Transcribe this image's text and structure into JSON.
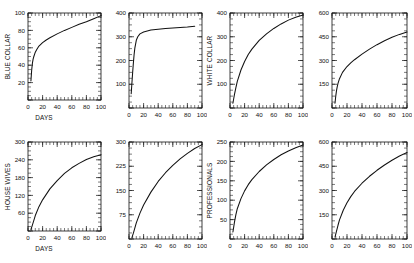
{
  "figure": {
    "layout": "2 rows x 4 columns of small-multiple line plots",
    "background_color": "#ffffff",
    "line_color": "#111111"
  },
  "chart_data": [
    {
      "type": "line",
      "title": "",
      "xlabel": "DAYS",
      "ylabel": "BLUE COLLAR",
      "xlim": [
        0,
        100
      ],
      "ylim": [
        0,
        100
      ],
      "xticks": [
        0,
        20,
        40,
        60,
        80,
        100
      ],
      "yticks": [
        0,
        20,
        40,
        60,
        80,
        100
      ],
      "grid": false,
      "legend": "none",
      "minor_ticks": true,
      "x": [
        4,
        5,
        6,
        7,
        8,
        10,
        12,
        15,
        20,
        25,
        30,
        40,
        50,
        60,
        70,
        80,
        90,
        100
      ],
      "values": [
        22,
        34,
        42,
        47,
        50,
        55,
        58,
        62,
        66,
        69,
        71.5,
        76,
        80,
        83.5,
        87,
        90,
        93.5,
        97
      ]
    },
    {
      "type": "line",
      "title": "",
      "xlabel": "",
      "ylabel": "",
      "xlim": [
        0,
        100
      ],
      "ylim": [
        0,
        400
      ],
      "xticks": [
        0,
        20,
        40,
        60,
        80,
        100
      ],
      "yticks": [
        0,
        100,
        200,
        300,
        400
      ],
      "grid": false,
      "legend": "none",
      "minor_ticks": true,
      "x": [
        3,
        4,
        5,
        6,
        7,
        8,
        10,
        12,
        15,
        20,
        30,
        40,
        50,
        60,
        70,
        80,
        90
      ],
      "values": [
        60,
        105,
        150,
        190,
        225,
        252,
        285,
        300,
        312,
        320,
        328,
        332,
        335,
        337,
        339,
        341,
        344
      ]
    },
    {
      "type": "line",
      "title": "",
      "xlabel": "",
      "ylabel": "WHITE COLLAR",
      "xlim": [
        0,
        100
      ],
      "ylim": [
        0,
        400
      ],
      "xticks": [
        0,
        20,
        40,
        60,
        80,
        100
      ],
      "yticks": [
        0,
        100,
        200,
        300,
        400
      ],
      "grid": false,
      "legend": "none",
      "minor_ticks": true,
      "x": [
        4,
        5,
        6,
        8,
        10,
        15,
        20,
        25,
        30,
        40,
        50,
        60,
        70,
        80,
        90,
        100
      ],
      "values": [
        20,
        38,
        55,
        85,
        112,
        160,
        196,
        225,
        248,
        285,
        312,
        335,
        354,
        370,
        382,
        392
      ]
    },
    {
      "type": "line",
      "title": "",
      "xlabel": "",
      "ylabel": "",
      "xlim": [
        0,
        100
      ],
      "ylim": [
        0,
        600
      ],
      "xticks": [
        0,
        20,
        40,
        60,
        80,
        100
      ],
      "yticks": [
        0,
        150,
        300,
        450,
        600
      ],
      "grid": false,
      "legend": "none",
      "minor_ticks": true,
      "x": [
        4,
        5,
        6,
        7,
        8,
        10,
        14,
        20,
        25,
        30,
        40,
        50,
        60,
        70,
        80,
        90,
        100
      ],
      "values": [
        30,
        75,
        110,
        135,
        155,
        185,
        225,
        262,
        285,
        305,
        340,
        372,
        400,
        425,
        447,
        465,
        480
      ]
    },
    {
      "type": "line",
      "title": "",
      "xlabel": "DAYS",
      "ylabel": "HOUSE WIVES",
      "xlim": [
        0,
        100
      ],
      "ylim": [
        0,
        300
      ],
      "xticks": [
        0,
        20,
        40,
        60,
        80,
        100
      ],
      "yticks": [
        0,
        60,
        120,
        180,
        240,
        300
      ],
      "grid": false,
      "legend": "none",
      "minor_ticks": true,
      "x": [
        4,
        6,
        10,
        15,
        20,
        30,
        40,
        50,
        60,
        70,
        80,
        90,
        100
      ],
      "values": [
        5,
        20,
        52,
        82,
        105,
        142,
        170,
        194,
        213,
        228,
        241,
        250,
        257
      ]
    },
    {
      "type": "line",
      "title": "",
      "xlabel": "",
      "ylabel": "",
      "xlim": [
        0,
        100
      ],
      "ylim": [
        0,
        300
      ],
      "xticks": [
        0,
        20,
        40,
        60,
        80,
        100
      ],
      "yticks": [
        0,
        75,
        150,
        225,
        300
      ],
      "grid": false,
      "legend": "none",
      "minor_ticks": true,
      "x": [
        4,
        6,
        10,
        15,
        20,
        30,
        40,
        50,
        60,
        70,
        80,
        90,
        100
      ],
      "values": [
        4,
        18,
        50,
        80,
        105,
        145,
        178,
        205,
        228,
        248,
        265,
        280,
        292
      ]
    },
    {
      "type": "line",
      "title": "",
      "xlabel": "",
      "ylabel": "PROFESSIONALS",
      "xlim": [
        0,
        100
      ],
      "ylim": [
        0,
        250
      ],
      "xticks": [
        0,
        20,
        40,
        60,
        80,
        100
      ],
      "yticks": [
        0,
        50,
        100,
        150,
        200,
        250
      ],
      "grid": false,
      "legend": "none",
      "minor_ticks": true,
      "x": [
        4,
        5,
        6,
        8,
        10,
        15,
        20,
        25,
        30,
        40,
        50,
        60,
        70,
        80,
        90,
        100
      ],
      "values": [
        18,
        30,
        42,
        62,
        78,
        104,
        124,
        140,
        153,
        174,
        191,
        205,
        217,
        227,
        235,
        242
      ]
    },
    {
      "type": "line",
      "title": "",
      "xlabel": "",
      "ylabel": "",
      "xlim": [
        0,
        100
      ],
      "ylim": [
        0,
        600
      ],
      "xticks": [
        0,
        20,
        40,
        60,
        80,
        100
      ],
      "yticks": [
        0,
        150,
        300,
        450,
        600
      ],
      "grid": false,
      "legend": "none",
      "minor_ticks": true,
      "x": [
        4,
        6,
        8,
        10,
        15,
        20,
        25,
        30,
        40,
        50,
        60,
        70,
        80,
        90,
        100
      ],
      "values": [
        12,
        48,
        85,
        118,
        178,
        224,
        262,
        294,
        345,
        388,
        425,
        458,
        487,
        513,
        535
      ]
    }
  ],
  "panels": [
    {
      "id": "panel-blue-collar",
      "ylabel": "BLUE COLLAR",
      "xlabel": "DAYS",
      "ytick_labels": [
        "20",
        "40",
        "60",
        "80",
        "100"
      ],
      "xtick_labels": [
        "0",
        "20",
        "40",
        "60",
        "80",
        "100"
      ]
    },
    {
      "id": "panel-row1-col2",
      "ylabel": "",
      "xlabel": "",
      "ytick_labels": [
        "100",
        "200",
        "300",
        "400"
      ],
      "xtick_labels": [
        "0",
        "20",
        "40",
        "60",
        "80",
        "100"
      ]
    },
    {
      "id": "panel-white-collar",
      "ylabel": "WHITE COLLAR",
      "xlabel": "",
      "ytick_labels": [
        "100",
        "200",
        "300",
        "400"
      ],
      "xtick_labels": [
        "0",
        "20",
        "40",
        "60",
        "80",
        "100"
      ]
    },
    {
      "id": "panel-row1-col4",
      "ylabel": "",
      "xlabel": "",
      "ytick_labels": [
        "150",
        "300",
        "450",
        "600"
      ],
      "xtick_labels": [
        "0",
        "20",
        "40",
        "60",
        "80",
        "100"
      ]
    },
    {
      "id": "panel-house-wives",
      "ylabel": "HOUSE WIVES",
      "xlabel": "DAYS",
      "ytick_labels": [
        "60",
        "120",
        "180",
        "240",
        "300"
      ],
      "xtick_labels": [
        "0",
        "20",
        "40",
        "60",
        "80",
        "100"
      ]
    },
    {
      "id": "panel-row2-col2",
      "ylabel": "",
      "xlabel": "",
      "ytick_labels": [
        "75",
        "150",
        "225",
        "300"
      ],
      "xtick_labels": [
        "0",
        "20",
        "40",
        "60",
        "80",
        "100"
      ]
    },
    {
      "id": "panel-professionals",
      "ylabel": "PROFESSIONALS",
      "xlabel": "",
      "ytick_labels": [
        "50",
        "100",
        "150",
        "200",
        "250"
      ],
      "xtick_labels": [
        "0",
        "20",
        "40",
        "60",
        "80",
        "100"
      ]
    },
    {
      "id": "panel-row2-col4",
      "ylabel": "",
      "xlabel": "",
      "ytick_labels": [
        "150",
        "300",
        "450",
        "600"
      ],
      "xtick_labels": [
        "0",
        "20",
        "40",
        "60",
        "80",
        "100"
      ]
    }
  ]
}
